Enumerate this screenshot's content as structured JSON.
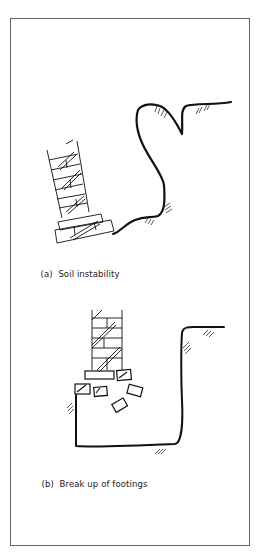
{
  "figures": [
    {
      "label": "(a)",
      "caption": "Soil instability"
    },
    {
      "label": "(b)",
      "caption": "Break up of footings"
    }
  ],
  "colors": {
    "line": "#111111",
    "frame": "#666666",
    "background": "#ffffff"
  }
}
